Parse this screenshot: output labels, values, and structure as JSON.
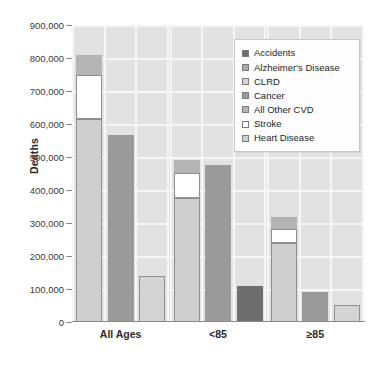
{
  "chart_data": {
    "type": "bar",
    "title": "",
    "subtitle": "",
    "xlabel": "",
    "ylabel": "Deaths",
    "ylim": [
      0,
      900000
    ],
    "ytick_values": [
      0,
      100000,
      200000,
      300000,
      400000,
      500000,
      600000,
      700000,
      800000,
      900000
    ],
    "ytick_labels": [
      "0",
      "100,000",
      "200,000",
      "300,000",
      "400,000",
      "500,000",
      "600,000",
      "700,000",
      "800,000",
      "900,000"
    ],
    "grid": true,
    "grid_axis": "both",
    "legend_position": "top-right",
    "categories": [
      "All Ages",
      "<85",
      "≥85"
    ],
    "series": [
      {
        "name": "Accidents",
        "color": "#6e6e6e",
        "values": [
          0,
          0,
          108000
        ]
      },
      {
        "name": "Alzheimer's Disease",
        "color": "#a9a9a9",
        "values": [
          0,
          0,
          0
        ]
      },
      {
        "name": "CLRD",
        "color": "#d4d4d4",
        "values": [
          140000,
          0,
          53000
        ]
      },
      {
        "name": "Cancer",
        "color": "#9a9a9a",
        "values": [
          566000,
          475000,
          92000
        ]
      },
      {
        "name": "All Other CVD",
        "color": "#b4b4b4",
        "values": [
          60000,
          40000,
          35000
        ]
      },
      {
        "name": "Stroke",
        "color": "#ffffff",
        "values": [
          135000,
          75000,
          43000
        ]
      },
      {
        "name": "Heart Disease",
        "color": "#cfcfcf",
        "values": [
          615000,
          377000,
          240000
        ]
      }
    ],
    "stacked_groups": [
      {
        "name": "Cardiovascular disease stack",
        "members": [
          "Heart Disease",
          "Stroke",
          "All Other CVD"
        ]
      }
    ],
    "bars": [
      {
        "group": "All Ages",
        "index": 0,
        "kind": "stacked",
        "total": 810000,
        "segments": [
          {
            "series": "Heart Disease",
            "value": 615000,
            "color": "#cfcfcf"
          },
          {
            "series": "Stroke",
            "value": 135000,
            "color": "#ffffff"
          },
          {
            "series": "All Other CVD",
            "value": 60000,
            "color": "#b4b4b4"
          }
        ]
      },
      {
        "group": "All Ages",
        "index": 1,
        "kind": "single",
        "total": 566000,
        "segments": [
          {
            "series": "Cancer",
            "value": 566000,
            "color": "#9a9a9a"
          }
        ]
      },
      {
        "group": "All Ages",
        "index": 2,
        "kind": "single",
        "total": 140000,
        "segments": [
          {
            "series": "CLRD",
            "value": 140000,
            "color": "#d4d4d4"
          }
        ]
      },
      {
        "group": "<85",
        "index": 0,
        "kind": "stacked",
        "total": 492000,
        "segments": [
          {
            "series": "Heart Disease",
            "value": 377000,
            "color": "#cfcfcf"
          },
          {
            "series": "Stroke",
            "value": 75000,
            "color": "#ffffff"
          },
          {
            "series": "All Other CVD",
            "value": 40000,
            "color": "#b4b4b4"
          }
        ]
      },
      {
        "group": "<85",
        "index": 1,
        "kind": "single",
        "total": 475000,
        "segments": [
          {
            "series": "Cancer",
            "value": 475000,
            "color": "#9a9a9a"
          }
        ]
      },
      {
        "group": "<85",
        "index": 2,
        "kind": "single",
        "total": 108000,
        "segments": [
          {
            "series": "Accidents",
            "value": 108000,
            "color": "#6e6e6e"
          }
        ]
      },
      {
        "group": "≥85",
        "index": 0,
        "kind": "stacked",
        "total": 318000,
        "segments": [
          {
            "series": "Heart Disease",
            "value": 240000,
            "color": "#cfcfcf"
          },
          {
            "series": "Stroke",
            "value": 43000,
            "color": "#ffffff"
          },
          {
            "series": "All Other CVD",
            "value": 35000,
            "color": "#b4b4b4"
          }
        ]
      },
      {
        "group": "≥85",
        "index": 1,
        "kind": "single",
        "total": 92000,
        "segments": [
          {
            "series": "Cancer",
            "value": 92000,
            "color": "#9a9a9a"
          }
        ]
      },
      {
        "group": "≥85",
        "index": 2,
        "kind": "single",
        "total": 53000,
        "segments": [
          {
            "series": "CLRD",
            "value": 53000,
            "color": "#d4d4d4"
          }
        ]
      }
    ]
  },
  "axes": {
    "y_title": "Deaths",
    "y_labels": [
      "900,000",
      "800,000",
      "700,000",
      "600,000",
      "500,000",
      "400,000",
      "300,000",
      "200,000",
      "100,000",
      "0"
    ],
    "x_labels": [
      "All Ages",
      "<85",
      "≥85"
    ]
  },
  "legend": {
    "items": [
      {
        "label": "Accidents",
        "color": "#6e6e6e"
      },
      {
        "label": "Alzheimer's Disease",
        "color": "#a9a9a9"
      },
      {
        "label": "CLRD",
        "color": "#d4d4d4"
      },
      {
        "label": "Cancer",
        "color": "#9a9a9a"
      },
      {
        "label": "All Other CVD",
        "color": "#b4b4b4"
      },
      {
        "label": "Stroke",
        "color": "#ffffff"
      },
      {
        "label": "Heart Disease",
        "color": "#cfcfcf"
      }
    ]
  },
  "colors": {
    "plot_background": "#e2e2e2",
    "gridline": "#f6f6f6",
    "axis_line": "#8a8a8a",
    "text": "#2b2b2b",
    "legend_background": "#fdfdfd",
    "legend_border": "#c8c8c8",
    "bar_outline": "#8f8f8f"
  }
}
